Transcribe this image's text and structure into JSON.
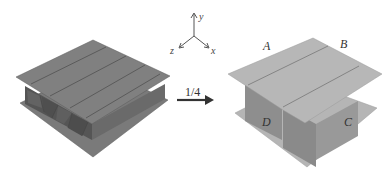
{
  "figure": {
    "left_panel": {
      "name": "full sandwich panel",
      "cores": 4
    },
    "arrow": {
      "label": "1/4"
    },
    "axes": {
      "x": "x",
      "y": "y",
      "z": "z"
    },
    "right_panel": {
      "name": "quarter unit cell",
      "corner_labels": {
        "A": "A",
        "B": "B",
        "C": "C",
        "D": "D"
      }
    }
  },
  "colors": {
    "left_top": "#7f7f7f",
    "left_side_dark": "#5e5e5e",
    "left_side_mid": "#6c6c6c",
    "left_line": "#4a4a4a",
    "right_top": "#b4b4b4",
    "right_side_dark": "#8a8a8a",
    "right_side_mid": "#9c9c9c",
    "right_line": "#6e6e6e"
  }
}
